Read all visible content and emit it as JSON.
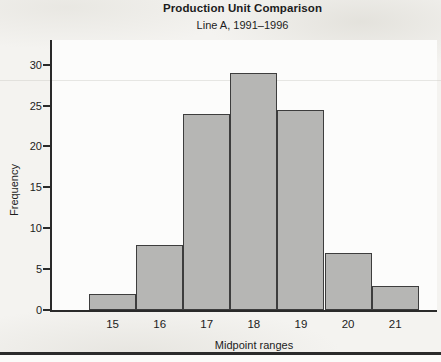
{
  "chart_data": {
    "type": "bar",
    "variant": "histogram",
    "title": "Production Unit Comparison",
    "subtitle": "Line A, 1991–1996",
    "xlabel": "Midpoint ranges",
    "ylabel": "Frequency",
    "categories": [
      "15",
      "16",
      "17",
      "18",
      "19",
      "20",
      "21"
    ],
    "values": [
      2,
      8,
      24,
      29,
      24.5,
      7,
      3
    ],
    "yticks": [
      0,
      5,
      10,
      15,
      20,
      25,
      30
    ],
    "ylim": [
      0,
      33
    ],
    "bar_gap": 0,
    "grid": false,
    "legend": "none",
    "colors": {
      "bar_fill": "#b6b6b4",
      "bar_border": "#3d3d3d",
      "axis": "#2a2a2a",
      "text": "#1c1c1c",
      "background": "#f4f3f0",
      "plot_background": "#fcfcfb",
      "bottom_rule": "#2b2b2b"
    }
  }
}
